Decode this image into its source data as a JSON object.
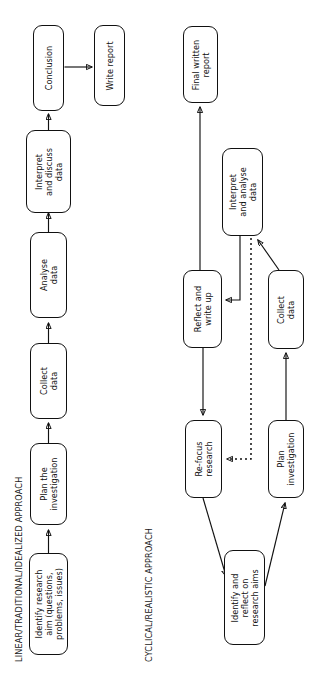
{
  "page": {
    "kind": "flowchart-figure",
    "orientation": "rotated-90-ccw",
    "background_color": "#ffffff",
    "line_color": "#111111"
  },
  "diagrams": [
    {
      "id": "linear",
      "title": "LINEAR/TRADITIONAL/IDEALIZED APPROACH",
      "nodes": [
        {
          "id": "l1",
          "label": "Identify research\naim (questions,\nproblems, issues)"
        },
        {
          "id": "l2",
          "label": "Plan the\ninvestigation"
        },
        {
          "id": "l3",
          "label": "Collect\ndata"
        },
        {
          "id": "l4",
          "label": "Analyse\ndata"
        },
        {
          "id": "l5",
          "label": "Interpret\nand discuss\ndata"
        },
        {
          "id": "l6",
          "label": "Conclusion"
        },
        {
          "id": "l7",
          "label": "Write report"
        }
      ],
      "edges": [
        {
          "from": "l1",
          "to": "l2",
          "style": "solid"
        },
        {
          "from": "l2",
          "to": "l3",
          "style": "solid"
        },
        {
          "from": "l3",
          "to": "l4",
          "style": "solid"
        },
        {
          "from": "l4",
          "to": "l5",
          "style": "solid"
        },
        {
          "from": "l5",
          "to": "l6",
          "style": "solid"
        },
        {
          "from": "l6",
          "to": "l7",
          "style": "solid"
        }
      ]
    },
    {
      "id": "cyclical",
      "title": "CYCLICAL/REALISTIC APPROACH",
      "nodes": [
        {
          "id": "c1",
          "label": "Identify and\nreflect on\nresearch aims"
        },
        {
          "id": "c2",
          "label": "Plan\ninvestigation"
        },
        {
          "id": "c3",
          "label": "Collect\ndata"
        },
        {
          "id": "c4",
          "label": "Interpret\nand analyse\ndata"
        },
        {
          "id": "c5",
          "label": "Reflect and\nwrite up"
        },
        {
          "id": "c6",
          "label": "Re-focus\nresearch"
        },
        {
          "id": "c7",
          "label": "Final written\nreport"
        }
      ],
      "edges": [
        {
          "from": "c1",
          "to": "c2",
          "style": "solid"
        },
        {
          "from": "c2",
          "to": "c3",
          "style": "solid"
        },
        {
          "from": "c3",
          "to": "c4",
          "style": "solid"
        },
        {
          "from": "c4",
          "to": "c5",
          "style": "solid"
        },
        {
          "from": "c5",
          "to": "c7",
          "style": "solid"
        },
        {
          "from": "c5",
          "to": "c6",
          "style": "solid"
        },
        {
          "from": "c6",
          "to": "c1",
          "style": "solid"
        },
        {
          "from": "c4",
          "to": "c6",
          "style": "dotted"
        }
      ]
    }
  ]
}
